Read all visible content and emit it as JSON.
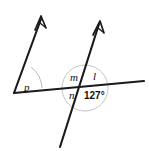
{
  "figure": {
    "kind": "geometry-diagram",
    "background_color": "#ffffff",
    "line_color": "#1a1a1a",
    "arc_color": "#a9a9a9",
    "label_color": "#111111",
    "angle_labels": {
      "p": "p",
      "m": "m",
      "l": "l",
      "n": "n",
      "measure": "127°"
    },
    "geometry": {
      "vertex_left": [
        14,
        93
      ],
      "ray_left_tip": [
        42,
        16
      ],
      "horizontal_line_start": [
        14,
        93
      ],
      "horizontal_line_end": [
        144,
        81
      ],
      "transversal_bottom": [
        60,
        146
      ],
      "transversal_tip": [
        100,
        21
      ],
      "intersection": [
        85,
        88
      ],
      "arc_left_radius": 28,
      "circle_right_radius": 23
    }
  }
}
